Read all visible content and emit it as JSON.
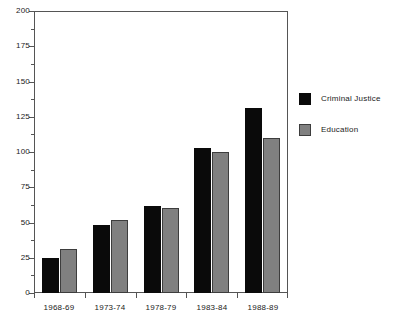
{
  "chart_data": {
    "type": "bar",
    "title": "",
    "xlabel": "",
    "ylabel": "",
    "categories": [
      "1968-69",
      "1973-74",
      "1978-79",
      "1983-84",
      "1988-89"
    ],
    "series": [
      {
        "name": "Criminal Justice",
        "color": "#0a0a0a",
        "values": [
          25,
          48,
          62,
          103,
          131
        ]
      },
      {
        "name": "Education",
        "color": "#808080",
        "values": [
          31,
          52,
          60,
          100,
          110
        ]
      }
    ],
    "ylim": [
      0,
      200
    ],
    "y_major_ticks": [
      0,
      25,
      50,
      75,
      100,
      125,
      150,
      175,
      200
    ],
    "y_minor_ticks": [
      12.5,
      37.5,
      62.5,
      87.5,
      112.5,
      137.5,
      162.5,
      187.5
    ],
    "y_tick_labels": [
      "0",
      "25",
      "50",
      "75",
      "100",
      "125",
      "150",
      "175",
      "200"
    ],
    "grid": false,
    "legend_position": "right",
    "legend": [
      {
        "label": "Criminal Justice",
        "color": "#0a0a0a"
      },
      {
        "label": "Education",
        "color": "#808080"
      }
    ],
    "axis_color": "#555555",
    "background": "#ffffff"
  }
}
